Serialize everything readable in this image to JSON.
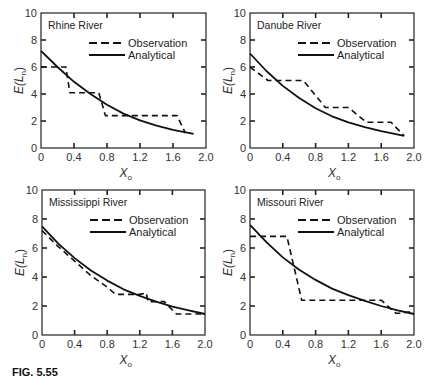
{
  "figure": {
    "caption_label": "FIG. 5.55",
    "caption_text": "Critical ... for different rivers (caption cut off at bottom edge)"
  },
  "legend": {
    "observation": "Observation",
    "analytical": "Analytical"
  },
  "axes": {
    "xlabel": "X",
    "xlabel_sub": "o",
    "ylabel": "E(L",
    "ylabel_sub": "n",
    "ylabel_close": ")",
    "xticks": [
      "0",
      "0.4",
      "0.8",
      "1.2",
      "1.6",
      "2.0"
    ],
    "yticks": [
      "0",
      "2",
      "4",
      "6",
      "8",
      "10"
    ]
  },
  "colors": {
    "line": "#111111",
    "frame": "#222222"
  },
  "chart_data": [
    {
      "type": "line",
      "title": "Rhine River",
      "xlabel": "X_o",
      "ylabel": "E(L_n)",
      "xlim": [
        0,
        2.0
      ],
      "ylim": [
        0,
        10
      ],
      "grid": false,
      "legend_position": "upper right",
      "series": [
        {
          "name": "Observation",
          "style": "dashed",
          "x": [
            0,
            0.3,
            0.35,
            0.7,
            0.78,
            1.65,
            1.75
          ],
          "y": [
            6.0,
            6.0,
            4.1,
            4.1,
            2.4,
            2.4,
            1.1
          ]
        },
        {
          "name": "Analytical",
          "style": "solid",
          "x": [
            0,
            0.2,
            0.4,
            0.6,
            0.8,
            1.0,
            1.2,
            1.4,
            1.6,
            1.85
          ],
          "y": [
            7.2,
            6.0,
            4.9,
            4.0,
            3.2,
            2.55,
            2.05,
            1.65,
            1.35,
            1.05
          ]
        }
      ]
    },
    {
      "type": "line",
      "title": "Danube River",
      "xlabel": "X_o",
      "ylabel": "E(L_n)",
      "xlim": [
        0,
        2.0
      ],
      "ylim": [
        0,
        10
      ],
      "grid": false,
      "legend_position": "upper right",
      "series": [
        {
          "name": "Observation",
          "style": "dashed",
          "x": [
            0,
            0.22,
            0.65,
            0.92,
            1.2,
            1.42,
            1.72,
            1.88
          ],
          "y": [
            6.0,
            5.0,
            5.0,
            3.0,
            3.0,
            1.9,
            1.9,
            0.9
          ]
        },
        {
          "name": "Analytical",
          "style": "solid",
          "x": [
            0,
            0.2,
            0.4,
            0.6,
            0.8,
            1.0,
            1.2,
            1.4,
            1.6,
            1.88
          ],
          "y": [
            7.0,
            5.7,
            4.6,
            3.7,
            2.95,
            2.35,
            1.9,
            1.55,
            1.25,
            0.9
          ]
        }
      ]
    },
    {
      "type": "line",
      "title": "Mississippi River",
      "xlabel": "X_o",
      "ylabel": "E(L_n)",
      "xlim": [
        0,
        2.0
      ],
      "ylim": [
        0,
        10
      ],
      "grid": false,
      "legend_position": "upper right",
      "series": [
        {
          "name": "Observation",
          "style": "dashed",
          "x": [
            0,
            0.2,
            0.4,
            0.6,
            0.8,
            0.9,
            1.05,
            1.2,
            1.28,
            1.3,
            1.5,
            1.55,
            1.65,
            2.0
          ],
          "y": [
            7.2,
            6.1,
            5.1,
            4.1,
            3.3,
            2.8,
            2.8,
            2.8,
            2.9,
            2.3,
            2.3,
            2.0,
            1.45,
            1.45
          ]
        },
        {
          "name": "Analytical",
          "style": "solid",
          "x": [
            0,
            0.2,
            0.4,
            0.6,
            0.8,
            1.0,
            1.2,
            1.4,
            1.6,
            1.8,
            2.0
          ],
          "y": [
            7.5,
            6.3,
            5.3,
            4.45,
            3.75,
            3.15,
            2.7,
            2.3,
            1.95,
            1.7,
            1.45
          ]
        }
      ]
    },
    {
      "type": "line",
      "title": "Missouri River",
      "xlabel": "X_o",
      "ylabel": "E(L_n)",
      "xlim": [
        0,
        2.0
      ],
      "ylim": [
        0,
        10
      ],
      "grid": false,
      "legend_position": "upper right",
      "series": [
        {
          "name": "Observation",
          "style": "dashed",
          "x": [
            0,
            0.45,
            0.63,
            1.6,
            1.78,
            1.85,
            1.95
          ],
          "y": [
            6.8,
            6.8,
            2.4,
            2.4,
            1.5,
            1.5,
            1.6
          ]
        },
        {
          "name": "Analytical",
          "style": "solid",
          "x": [
            0,
            0.2,
            0.4,
            0.6,
            0.8,
            1.0,
            1.2,
            1.4,
            1.6,
            1.8,
            2.0
          ],
          "y": [
            7.6,
            6.4,
            5.35,
            4.5,
            3.8,
            3.2,
            2.75,
            2.35,
            2.0,
            1.7,
            1.45
          ]
        }
      ]
    }
  ]
}
